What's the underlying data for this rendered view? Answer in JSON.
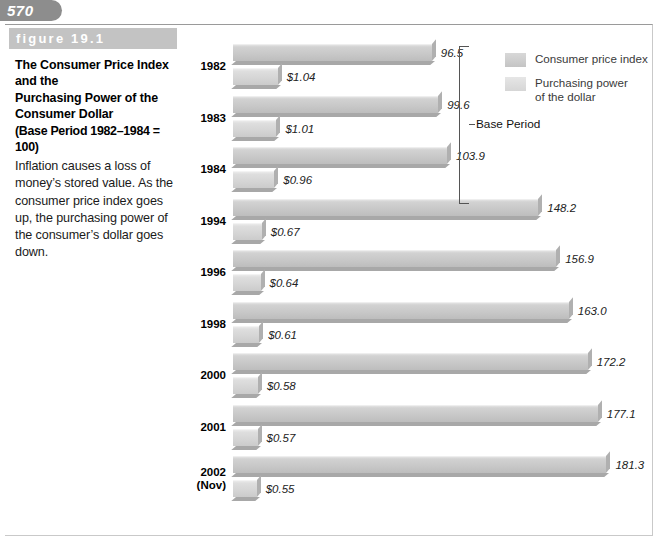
{
  "page": {
    "number": "570"
  },
  "figure": {
    "band_label": "figure 19.1",
    "title_line1": "The Consumer Price Index and the",
    "title_line2": "Purchasing Power of the",
    "title_line3": "Consumer Dollar",
    "subtitle": "(Base Period 1982–1984 = 100)",
    "body": "Inflation causes a loss of money’s stored value. As the consumer price index goes up, the purchasing power of the consumer’s dollar goes down."
  },
  "legend": {
    "items": [
      {
        "label": "Consumer price index",
        "swatch": "cpi",
        "color": "#c8c8c8"
      },
      {
        "label": "Purchasing power\nof the dollar",
        "label_line1": "Purchasing power",
        "label_line2": "of the dollar",
        "swatch": "ppd",
        "color": "#dcdcdc"
      }
    ]
  },
  "annotations": {
    "base_period_label": "Base Period"
  },
  "chart_data": {
    "type": "bar",
    "orientation": "horizontal",
    "title": "The Consumer Price Index and the Purchasing Power of the Consumer Dollar",
    "subtitle": "(Base Period 1982–1984 = 100)",
    "xlabel": "",
    "ylabel": "",
    "grid": false,
    "legend_position": "top-right",
    "categories": [
      "1982",
      "1983",
      "1984",
      "1994",
      "1996",
      "1998",
      "2000",
      "2001",
      "2002 (Nov)"
    ],
    "category_labels": [
      {
        "line1": "1982",
        "line2": ""
      },
      {
        "line1": "1983",
        "line2": ""
      },
      {
        "line1": "1984",
        "line2": ""
      },
      {
        "line1": "1994",
        "line2": ""
      },
      {
        "line1": "1996",
        "line2": ""
      },
      {
        "line1": "1998",
        "line2": ""
      },
      {
        "line1": "2000",
        "line2": ""
      },
      {
        "line1": "2001",
        "line2": ""
      },
      {
        "line1": "2002",
        "line2": "(Nov)"
      }
    ],
    "series": [
      {
        "name": "Consumer price index",
        "values": [
          96.5,
          99.6,
          103.9,
          148.2,
          156.9,
          163.0,
          172.2,
          177.1,
          181.3
        ],
        "value_labels": [
          "96.5",
          "99.6",
          "103.9",
          "148.2",
          "156.9",
          "163.0",
          "172.2",
          "177.1",
          "181.3"
        ]
      },
      {
        "name": "Purchasing power of the dollar",
        "values": [
          1.04,
          1.01,
          0.96,
          0.67,
          0.64,
          0.61,
          0.58,
          0.57,
          0.55
        ],
        "value_labels": [
          "$1.04",
          "$1.01",
          "$0.96",
          "$0.67",
          "$0.64",
          "$0.61",
          "$0.58",
          "$0.57",
          "$0.55"
        ]
      }
    ],
    "base_period_categories": [
      "1982",
      "1983",
      "1984"
    ],
    "annotation": "Base Period"
  }
}
